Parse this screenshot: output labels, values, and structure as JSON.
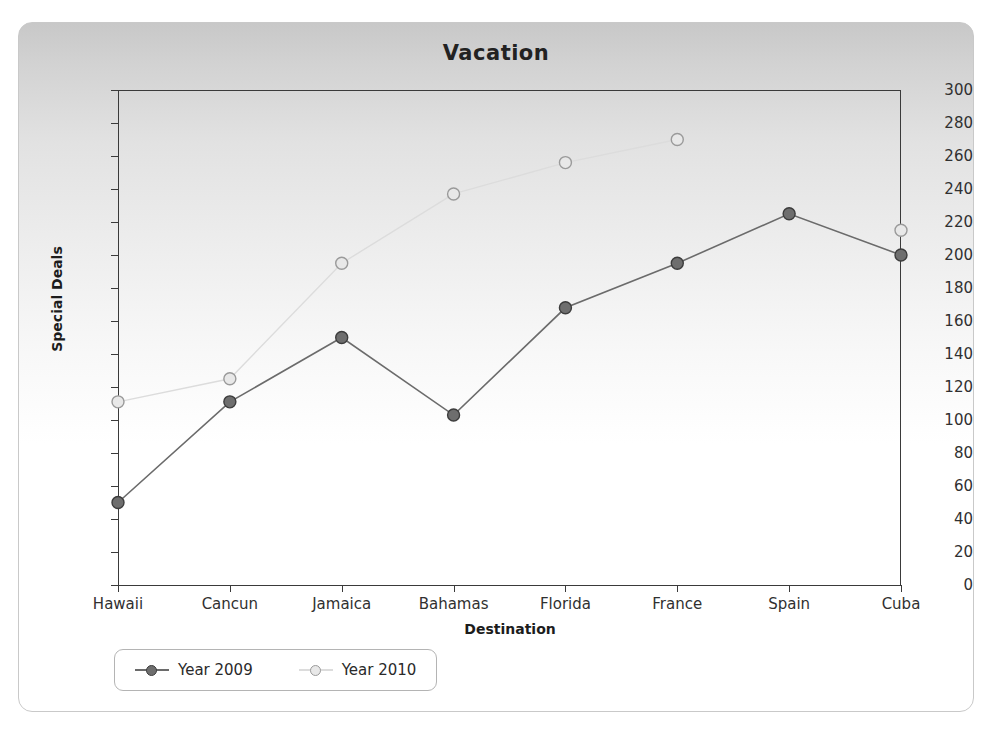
{
  "chart_data": {
    "type": "line",
    "title": "Vacation",
    "xlabel": "Destination",
    "ylabel": "Special Deals",
    "categories": [
      "Hawaii",
      "Cancun",
      "Jamaica",
      "Bahamas",
      "Florida",
      "France",
      "Spain",
      "Cuba"
    ],
    "series": [
      {
        "name": "Year 2009",
        "color": "#6b6b6b",
        "marker_fill": "#6e6e6e",
        "marker_stroke": "#3c3c3c",
        "values": [
          50,
          111,
          150,
          103,
          168,
          195,
          225,
          200
        ]
      },
      {
        "name": "Year 2010",
        "color": "#dcdcdc",
        "marker_fill": "#e8e8e8",
        "marker_stroke": "#9a9a9a",
        "values": [
          111,
          125,
          195,
          237,
          256,
          270,
          null,
          215
        ]
      }
    ],
    "ylim": [
      0,
      300
    ],
    "ytick_step": 20,
    "yticks": [
      0,
      20,
      40,
      60,
      80,
      100,
      120,
      140,
      160,
      180,
      200,
      220,
      240,
      260,
      280,
      300
    ],
    "grid": false,
    "legend_position": "bottom-left"
  },
  "legend": {
    "items": [
      {
        "label": "Year 2009"
      },
      {
        "label": "Year 2010"
      }
    ]
  }
}
